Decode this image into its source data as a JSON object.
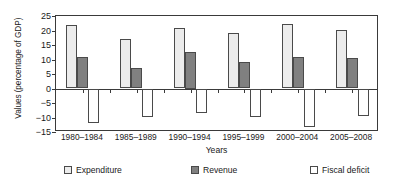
{
  "chart_data": {
    "type": "bar",
    "title": "",
    "xlabel": "Years",
    "ylabel": "Values (percentage of GDP)",
    "categories": [
      "1980–1984",
      "1985–1989",
      "1990–1994",
      "1995–1999",
      "2000–2004",
      "2005–2008"
    ],
    "series": [
      {
        "name": "Expenditure",
        "color": "#ececec",
        "values": [
          22.0,
          17.0,
          21.0,
          19.0,
          22.2,
          20.2
        ]
      },
      {
        "name": "Revenue",
        "color": "#808080",
        "values": [
          10.7,
          7.2,
          12.5,
          9.3,
          10.7,
          10.6
        ]
      },
      {
        "name": "Fiscal deficit",
        "color": "#ffffff",
        "values": [
          -11.8,
          -9.8,
          -8.5,
          -9.8,
          -13.3,
          -9.5
        ]
      }
    ],
    "ylim": [
      -15,
      25
    ],
    "yticks": [
      25,
      20,
      15,
      10,
      5,
      0,
      -5,
      -10,
      -15
    ],
    "ytick_labels": [
      "25",
      "20",
      "15",
      "10",
      "5",
      "0",
      "−5",
      "−10",
      "−15"
    ],
    "grid": false,
    "legend_position": "bottom",
    "axis_color": "#3a3a3a",
    "bar_edge_color": "#4a4a4a"
  }
}
